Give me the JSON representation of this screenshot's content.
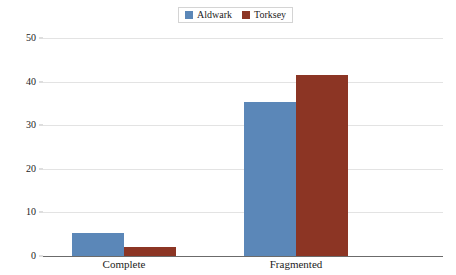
{
  "chart_data": {
    "type": "bar",
    "title": "",
    "subtitle": "",
    "xlabel": "",
    "ylabel": "",
    "categories": [
      "Complete",
      "Fragmented"
    ],
    "series": [
      {
        "name": "Aldwark",
        "color": "#5B87B8",
        "values": [
          5.2,
          35.3
        ]
      },
      {
        "name": "Torksey",
        "color": "#8C3524",
        "values": [
          2.0,
          41.5
        ]
      }
    ],
    "ylim": [
      0,
      50
    ],
    "yticks": [
      0,
      10,
      20,
      30,
      40,
      50
    ],
    "ytick_labels": [
      "0",
      "10",
      "20",
      "30",
      "40",
      "50"
    ],
    "grid": true,
    "legend_position": "top-center",
    "background_color": "#FFFFFF",
    "gridline_color": "#E3E3E3",
    "axis_color": "#6B6B6B"
  },
  "legend": {
    "entries": [
      {
        "label": "Aldwark",
        "color": "#5B87B8"
      },
      {
        "label": "Torksey",
        "color": "#8C3524"
      }
    ]
  },
  "axis": {
    "y_tick_labels": [
      "50",
      "40",
      "30",
      "20",
      "10",
      "0"
    ],
    "x_category_labels": [
      "Complete",
      "Fragmented"
    ]
  }
}
